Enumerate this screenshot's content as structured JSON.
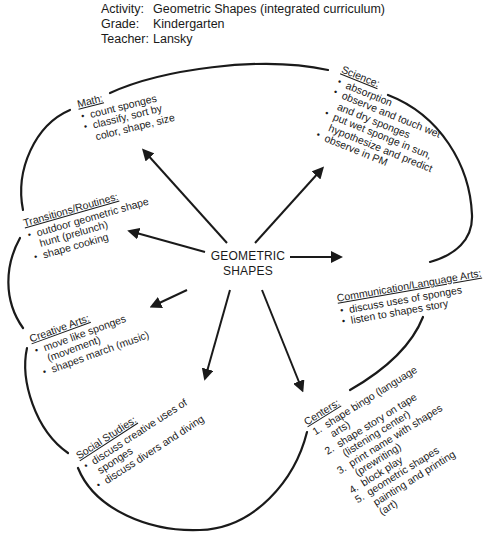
{
  "header": {
    "activity_label": "Activity:",
    "activity_value": "Geometric Shapes (integrated curriculum)",
    "grade_label": "Grade:",
    "grade_value": "Kindergarten",
    "teacher_label": "Teacher:",
    "teacher_value": "Lansky"
  },
  "center": {
    "line1": "GEOMETRIC",
    "line2": "SHAPES"
  },
  "nodes": {
    "math": {
      "title": "Math:",
      "items": [
        {
          "text": "count sponges"
        },
        {
          "text": "classify, sort by",
          "cont": "color, shape, size"
        }
      ]
    },
    "science": {
      "title": "Science:",
      "items": [
        {
          "text": "absorption"
        },
        {
          "text": "observe and touch wet",
          "cont": "and dry sponges"
        },
        {
          "text": "put wet sponge in sun,",
          "cont": "hypothesize and predict"
        },
        {
          "text": "observe in PM"
        }
      ]
    },
    "transitions": {
      "title": "Transitions/Routines:",
      "items": [
        {
          "text": "outdoor geometric shape",
          "cont": "hunt (prelunch)"
        },
        {
          "text": "shape cooking"
        }
      ]
    },
    "communication": {
      "title": "Communication/Language Arts:",
      "items": [
        {
          "text": "discuss uses of sponges"
        },
        {
          "text": "listen to shapes story"
        }
      ]
    },
    "creative_arts": {
      "title": "Creative Arts:",
      "items": [
        {
          "text": "move like sponges",
          "cont": "(movement)"
        },
        {
          "text": "shapes march (music)"
        }
      ]
    },
    "social_studies": {
      "title": "Social Studies:",
      "items": [
        {
          "text": "discuss creative uses of",
          "cont": "sponges"
        },
        {
          "text": "discuss divers and diving"
        }
      ]
    },
    "centers": {
      "title": "Centers:",
      "items": [
        {
          "num": "1.",
          "text": "shape bingo (language",
          "cont": "arts)"
        },
        {
          "num": "2.",
          "text": "shape story on tape",
          "cont": "(listening center)"
        },
        {
          "num": "3.",
          "text": "print name with shapes",
          "cont": "(prewriting)"
        },
        {
          "num": "4.",
          "text": "block play"
        },
        {
          "num": "5.",
          "text": "geometric shapes",
          "cont": "painting and printing",
          "cont2": "(art)"
        }
      ]
    }
  },
  "colors": {
    "ink": "#1a1a1a",
    "background": "#ffffff"
  }
}
